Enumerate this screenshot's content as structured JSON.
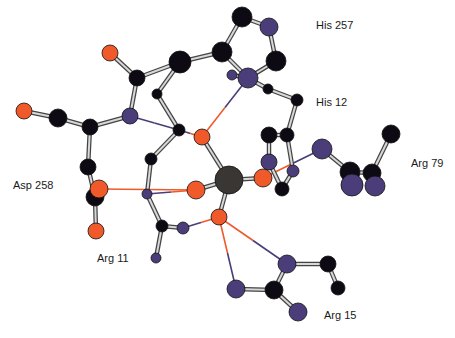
{
  "diagram": {
    "type": "ball-and-stick molecular structure",
    "colors": {
      "carbon": "#0d0a14",
      "nitrogen": "#4a3d7a",
      "oxygen": "#f05a2a",
      "metal": "#3a3633",
      "background": "#ffffff",
      "bond_fill": "#d8d8d8",
      "bond_edge": "#444444"
    },
    "labels": [
      {
        "id": "his257",
        "text": "His 257",
        "x": 316,
        "y": 26
      },
      {
        "id": "his12",
        "text": "His 12",
        "x": 316,
        "y": 103
      },
      {
        "id": "arg79",
        "text": "Arg 79",
        "x": 411,
        "y": 164
      },
      {
        "id": "asp258",
        "text": "Asp 258",
        "x": 13,
        "y": 186
      },
      {
        "id": "arg11",
        "text": "Arg 11",
        "x": 97,
        "y": 259
      },
      {
        "id": "arg15",
        "text": "Arg 15",
        "x": 324,
        "y": 316
      }
    ],
    "atoms": [
      {
        "id": "a1",
        "el": "C",
        "x": 242,
        "y": 17,
        "r": 10
      },
      {
        "id": "a2",
        "el": "N",
        "x": 269,
        "y": 27,
        "r": 9
      },
      {
        "id": "a3",
        "el": "C",
        "x": 276,
        "y": 61,
        "r": 10
      },
      {
        "id": "a4",
        "el": "C",
        "x": 222,
        "y": 52,
        "r": 10
      },
      {
        "id": "a5",
        "el": "N",
        "x": 248,
        "y": 78,
        "r": 10
      },
      {
        "id": "a6",
        "el": "N",
        "x": 232,
        "y": 75,
        "r": 5
      },
      {
        "id": "a7",
        "el": "C",
        "x": 180,
        "y": 62,
        "r": 11
      },
      {
        "id": "a8",
        "el": "C",
        "x": 137,
        "y": 78,
        "r": 8
      },
      {
        "id": "a9",
        "el": "O",
        "x": 110,
        "y": 53,
        "r": 8
      },
      {
        "id": "a10",
        "el": "N",
        "x": 130,
        "y": 116,
        "r": 8
      },
      {
        "id": "a11",
        "el": "C",
        "x": 157,
        "y": 94,
        "r": 5
      },
      {
        "id": "a12",
        "el": "C",
        "x": 179,
        "y": 130,
        "r": 6
      },
      {
        "id": "a13",
        "el": "O",
        "x": 202,
        "y": 137,
        "r": 8
      },
      {
        "id": "a14",
        "el": "C",
        "x": 90,
        "y": 127,
        "r": 8
      },
      {
        "id": "a15",
        "el": "C",
        "x": 58,
        "y": 118,
        "r": 9
      },
      {
        "id": "a16",
        "el": "O",
        "x": 24,
        "y": 111,
        "r": 8
      },
      {
        "id": "a17",
        "el": "C",
        "x": 88,
        "y": 167,
        "r": 8
      },
      {
        "id": "a18",
        "el": "C",
        "x": 151,
        "y": 159,
        "r": 6
      },
      {
        "id": "a19",
        "el": "C",
        "x": 95,
        "y": 197,
        "r": 9
      },
      {
        "id": "a20",
        "el": "O",
        "x": 99,
        "y": 189,
        "r": 9
      },
      {
        "id": "a21",
        "el": "O",
        "x": 96,
        "y": 231,
        "r": 8
      },
      {
        "id": "a22",
        "el": "N",
        "x": 147,
        "y": 194,
        "r": 5
      },
      {
        "id": "a23",
        "el": "O",
        "x": 196,
        "y": 190,
        "r": 9
      },
      {
        "id": "a24",
        "el": "M",
        "x": 229,
        "y": 180,
        "r": 14
      },
      {
        "id": "a25",
        "el": "O",
        "x": 219,
        "y": 217,
        "r": 8
      },
      {
        "id": "a26",
        "el": "C",
        "x": 162,
        "y": 226,
        "r": 6
      },
      {
        "id": "a27",
        "el": "N",
        "x": 183,
        "y": 228,
        "r": 6
      },
      {
        "id": "a28",
        "el": "N",
        "x": 156,
        "y": 258,
        "r": 5
      },
      {
        "id": "a29",
        "el": "C",
        "x": 268,
        "y": 89,
        "r": 5
      },
      {
        "id": "a30",
        "el": "C",
        "x": 297,
        "y": 100,
        "r": 6
      },
      {
        "id": "a31",
        "el": "C",
        "x": 269,
        "y": 135,
        "r": 8
      },
      {
        "id": "a32",
        "el": "C",
        "x": 287,
        "y": 135,
        "r": 7
      },
      {
        "id": "a33",
        "el": "N",
        "x": 269,
        "y": 162,
        "r": 8
      },
      {
        "id": "a34",
        "el": "O",
        "x": 263,
        "y": 178,
        "r": 9
      },
      {
        "id": "a35",
        "el": "N",
        "x": 293,
        "y": 171,
        "r": 6
      },
      {
        "id": "a36",
        "el": "C",
        "x": 282,
        "y": 189,
        "r": 7
      },
      {
        "id": "a37",
        "el": "N",
        "x": 322,
        "y": 149,
        "r": 10
      },
      {
        "id": "a38",
        "el": "C",
        "x": 350,
        "y": 172,
        "r": 10
      },
      {
        "id": "a39",
        "el": "C",
        "x": 372,
        "y": 173,
        "r": 9
      },
      {
        "id": "a40",
        "el": "C",
        "x": 391,
        "y": 134,
        "r": 9
      },
      {
        "id": "a41",
        "el": "N",
        "x": 352,
        "y": 185,
        "r": 11
      },
      {
        "id": "a42",
        "el": "N",
        "x": 375,
        "y": 186,
        "r": 10
      },
      {
        "id": "a43",
        "el": "N",
        "x": 287,
        "y": 264,
        "r": 9
      },
      {
        "id": "a44",
        "el": "C",
        "x": 328,
        "y": 264,
        "r": 8
      },
      {
        "id": "a45",
        "el": "C",
        "x": 338,
        "y": 288,
        "r": 7
      },
      {
        "id": "a46",
        "el": "N",
        "x": 236,
        "y": 289,
        "r": 9
      },
      {
        "id": "a47",
        "el": "C",
        "x": 274,
        "y": 290,
        "r": 9
      },
      {
        "id": "a48",
        "el": "N",
        "x": 298,
        "y": 312,
        "r": 9
      }
    ],
    "bonds": [
      [
        "a1",
        "a2"
      ],
      [
        "a2",
        "a3"
      ],
      [
        "a3",
        "a5"
      ],
      [
        "a1",
        "a4"
      ],
      [
        "a4",
        "a5"
      ],
      [
        "a4",
        "a7"
      ],
      [
        "a5",
        "a6"
      ],
      [
        "a7",
        "a8"
      ],
      [
        "a8",
        "a9"
      ],
      [
        "a8",
        "a10"
      ],
      [
        "a7",
        "a11"
      ],
      [
        "a11",
        "a12"
      ],
      [
        "a10",
        "a14"
      ],
      [
        "a14",
        "a15"
      ],
      [
        "a15",
        "a16"
      ],
      [
        "a14",
        "a17"
      ],
      [
        "a12",
        "a18"
      ],
      [
        "a18",
        "a22"
      ],
      [
        "a17",
        "a19"
      ],
      [
        "a19",
        "a21"
      ],
      [
        "a22",
        "a26"
      ],
      [
        "a26",
        "a27"
      ],
      [
        "a26",
        "a28"
      ],
      [
        "a13",
        "a24"
      ],
      [
        "a23",
        "a24"
      ],
      [
        "a24",
        "a25"
      ],
      [
        "a24",
        "a34"
      ],
      [
        "a5",
        "a29"
      ],
      [
        "a29",
        "a30"
      ],
      [
        "a30",
        "a32"
      ],
      [
        "a31",
        "a33"
      ],
      [
        "a32",
        "a35"
      ],
      [
        "a33",
        "a36"
      ],
      [
        "a35",
        "a36"
      ],
      [
        "a31",
        "a32"
      ],
      [
        "a37",
        "a38"
      ],
      [
        "a38",
        "a39"
      ],
      [
        "a39",
        "a40"
      ],
      [
        "a38",
        "a41"
      ],
      [
        "a39",
        "a42"
      ],
      [
        "a43",
        "a44"
      ],
      [
        "a44",
        "a45"
      ],
      [
        "a43",
        "a47"
      ],
      [
        "a46",
        "a47"
      ],
      [
        "a47",
        "a48"
      ]
    ],
    "coordination": [
      [
        "a10",
        "a12",
        "N"
      ],
      [
        "a12",
        "a13",
        "O"
      ],
      [
        "a5",
        "a13",
        "O"
      ],
      [
        "a20",
        "a23",
        "O"
      ],
      [
        "a22",
        "a23",
        "O"
      ],
      [
        "a33",
        "a34",
        "O"
      ],
      [
        "a34",
        "a37",
        "N"
      ],
      [
        "a25",
        "a43",
        "N"
      ],
      [
        "a25",
        "a46",
        "N"
      ],
      [
        "a25",
        "a27",
        "N"
      ]
    ]
  }
}
